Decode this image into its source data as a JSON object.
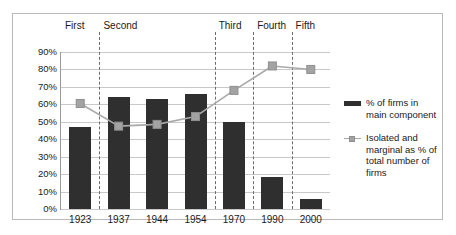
{
  "chart_data": {
    "type": "bar",
    "title": "",
    "subtitle": "",
    "xlabel": "",
    "ylabel": "",
    "ylim": [
      0,
      90
    ],
    "grid": true,
    "legend_position": "right",
    "categories": [
      "1923",
      "1937",
      "1944",
      "1954",
      "1970",
      "1990",
      "2000"
    ],
    "ytick_labels": [
      "0%",
      "10%",
      "20%",
      "30%",
      "40%",
      "50%",
      "60%",
      "70%",
      "80%",
      "90%"
    ],
    "ytick_values": [
      0,
      10,
      20,
      30,
      40,
      50,
      60,
      70,
      80,
      90
    ],
    "series": [
      {
        "name": "% of firms in main component",
        "type": "bar",
        "color": "#2f2f2f",
        "values": [
          47,
          64,
          63,
          66,
          50,
          18.5,
          5.5
        ]
      },
      {
        "name": "Isolated and marginal as % of total number of firms",
        "type": "line",
        "color": "#a9a9a9",
        "marker_color": "#a3a3a3",
        "values": [
          60.5,
          47.5,
          48.5,
          53,
          68,
          82,
          80
        ]
      }
    ],
    "period_annotations": [
      {
        "label": "First",
        "categories": [
          "1923"
        ]
      },
      {
        "label": "Second",
        "categories": [
          "1937",
          "1944",
          "1954"
        ]
      },
      {
        "label": "Third",
        "categories": [
          "1970"
        ]
      },
      {
        "label": "Fourth",
        "categories": [
          "1990"
        ]
      },
      {
        "label": "Fifth",
        "categories": [
          "2000"
        ]
      }
    ],
    "period_divider_after_index": [
      0,
      3,
      4,
      5
    ]
  },
  "legend": {
    "entries": [
      {
        "label": "% of firms in main component",
        "marker": "bar-swatch"
      },
      {
        "label": "Isolated and marginal as % of total number of firms",
        "marker": "line-marker-swatch"
      }
    ]
  },
  "colors": {
    "bar": "#2f2f2f",
    "line": "#a9a9a9",
    "marker": "#a3a3a3",
    "grid": "#c9c9c9",
    "axis": "#9a9a9a",
    "frame": "#b9b9b9",
    "divider": "#6b6b6b",
    "background": "#ffffff"
  }
}
